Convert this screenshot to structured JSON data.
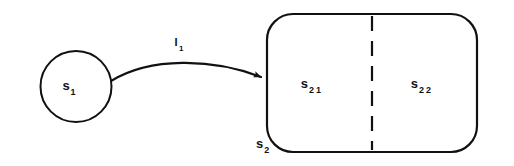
{
  "diagram": {
    "type": "state-transition-diagram",
    "background_color": "#ffffff",
    "stroke_color": "#111111",
    "simple_state": {
      "id": "s1",
      "shape": "circle",
      "label_main": "s",
      "label_sub": "1"
    },
    "transition": {
      "id": "I1",
      "shape": "curved-arrow",
      "from": "s1",
      "to": "s2",
      "label_main": "I",
      "label_sub": "1",
      "arrowhead": "solid-triangle"
    },
    "composite_state": {
      "id": "s2",
      "shape": "rounded-rectangle",
      "label_main": "s",
      "label_sub": "2",
      "divider": "dashed-vertical",
      "regions": [
        {
          "id": "s21",
          "label_main": "s",
          "label_sub_first": "2",
          "label_sub_second": "1"
        },
        {
          "id": "s22",
          "label_main": "s",
          "label_sub_first": "2",
          "label_sub_second": "2"
        }
      ]
    }
  }
}
